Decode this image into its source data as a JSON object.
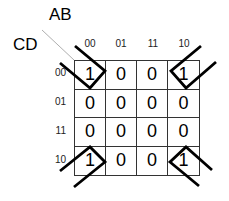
{
  "kmap": {
    "col_var": "AB",
    "row_var": "CD",
    "col_headers": [
      "00",
      "01",
      "11",
      "10"
    ],
    "row_headers": [
      "00",
      "01",
      "11",
      "10"
    ],
    "cells": [
      [
        "1",
        "0",
        "0",
        "1"
      ],
      [
        "0",
        "0",
        "0",
        "0"
      ],
      [
        "0",
        "0",
        "0",
        "0"
      ],
      [
        "1",
        "0",
        "0",
        "1"
      ]
    ],
    "grouping": "four corners",
    "colors": {
      "line": "#000000",
      "grid": "#333333",
      "diagonal": "#999999"
    }
  }
}
